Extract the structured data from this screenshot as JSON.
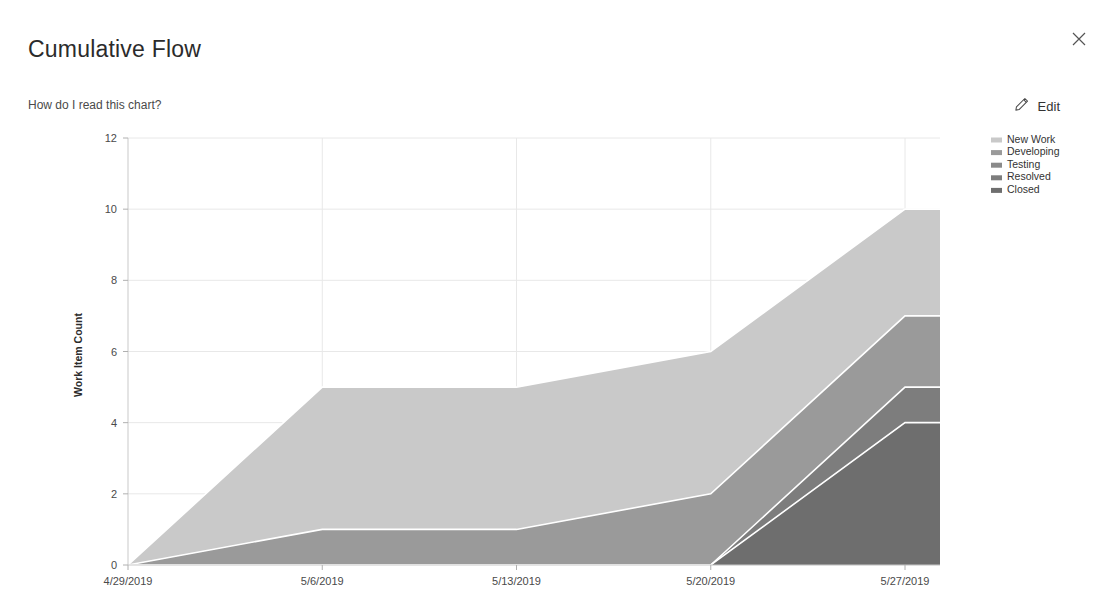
{
  "header": {
    "title": "Cumulative Flow",
    "help_link": "How do I read this chart?",
    "edit_label": "Edit",
    "close_icon": "close-icon",
    "edit_icon": "pencil-icon"
  },
  "chart_data": {
    "type": "area",
    "title": "Cumulative Flow",
    "xlabel": "",
    "ylabel": "Work Item Count",
    "stacked": true,
    "grid": true,
    "legend_position": "top-right",
    "x": [
      "4/29/2019",
      "5/6/2019",
      "5/13/2019",
      "5/20/2019",
      "5/27/2019",
      "5/30/2019"
    ],
    "xtick_labels": [
      "4/29/2019",
      "5/6/2019",
      "5/13/2019",
      "5/20/2019",
      "5/27/2019"
    ],
    "ytick_labels": [
      "0",
      "2",
      "4",
      "6",
      "8",
      "10",
      "12"
    ],
    "yticks": [
      0,
      2,
      4,
      6,
      8,
      10,
      12
    ],
    "ylim": [
      0,
      12
    ],
    "series": [
      {
        "name": "New Work",
        "color": "#c9c9c9",
        "values": [
          0,
          4,
          4,
          4,
          3,
          3
        ]
      },
      {
        "name": "Developing",
        "color": "#9a9a9a",
        "values": [
          0,
          1,
          1,
          2,
          2,
          2
        ]
      },
      {
        "name": "Testing",
        "color": "#8a8a8a",
        "values": [
          0,
          0,
          0,
          0,
          0,
          0
        ]
      },
      {
        "name": "Resolved",
        "color": "#7d7d7d",
        "values": [
          0,
          0,
          0,
          0,
          1,
          1
        ]
      },
      {
        "name": "Closed",
        "color": "#6e6e6e",
        "values": [
          0,
          0,
          0,
          0,
          4,
          4
        ]
      }
    ],
    "cumulative_totals": {
      "Closed": [
        0,
        0,
        0,
        0,
        4,
        4
      ],
      "Resolved": [
        0,
        0,
        0,
        0,
        5,
        5
      ],
      "Testing": [
        0,
        0,
        0,
        0,
        5,
        5
      ],
      "Developing": [
        0,
        1,
        1,
        2,
        7,
        7
      ],
      "New Work": [
        0,
        5,
        5,
        6,
        10,
        10
      ]
    },
    "legend": [
      {
        "label": "New Work",
        "color": "#c9c9c9"
      },
      {
        "label": "Developing",
        "color": "#9a9a9a"
      },
      {
        "label": "Testing",
        "color": "#8a8a8a"
      },
      {
        "label": "Resolved",
        "color": "#7d7d7d"
      },
      {
        "label": "Closed",
        "color": "#6e6e6e"
      }
    ]
  }
}
